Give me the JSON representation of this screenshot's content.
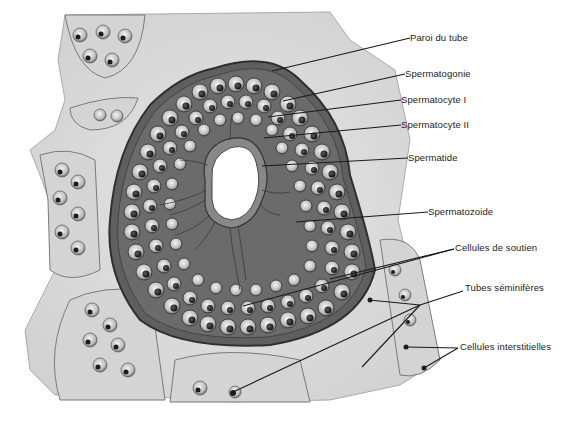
{
  "figure": {
    "colors": {
      "background": "#ffffff",
      "tissue": "#d9d9d9",
      "tissue_light": "#e8e8e8",
      "cell_outline": "#3a3a3a",
      "nucleus": "#2a2a2a",
      "leader_line": "#1a1a1a",
      "label_text": "#222222"
    }
  },
  "labels": [
    {
      "id": "paroi",
      "text": "Paroi du tube",
      "x": 410,
      "y": 33,
      "line": [
        [
          410,
          38
        ],
        [
          272,
          71
        ]
      ]
    },
    {
      "id": "spermatogonie",
      "text": "Spermatogonie",
      "x": 405,
      "y": 69,
      "line": [
        [
          405,
          74
        ],
        [
          283,
          101
        ]
      ]
    },
    {
      "id": "spermatocyte1",
      "text": "Spermatocyte I",
      "x": 401,
      "y": 95,
      "line": [
        [
          401,
          100
        ],
        [
          268,
          117
        ]
      ]
    },
    {
      "id": "spermatocyte2",
      "text": "Spermatocyte II",
      "x": 401,
      "y": 120,
      "line": [
        [
          401,
          125
        ],
        [
          264,
          138
        ]
      ]
    },
    {
      "id": "spermatide",
      "text": "Spermatide",
      "x": 408,
      "y": 153,
      "line": [
        [
          408,
          158
        ],
        [
          262,
          166
        ]
      ]
    },
    {
      "id": "spermatozoide",
      "text": "Spermatozoide",
      "x": 428,
      "y": 207,
      "line": [
        [
          428,
          212
        ],
        [
          296,
          222
        ]
      ]
    },
    {
      "id": "soutien",
      "text": "Cellules de soutien",
      "x": 455,
      "y": 243,
      "lines": [
        [
          [
            454,
            249
          ],
          [
            243,
            306
          ]
        ],
        [
          [
            454,
            249
          ],
          [
            330,
            279
          ]
        ]
      ]
    },
    {
      "id": "tubes",
      "text": "Tubes séminifères",
      "x": 465,
      "y": 283,
      "lines": [
        [
          [
            463,
            291
          ],
          [
            420,
            305
          ]
        ],
        [
          [
            420,
            305
          ],
          [
            233,
            392
          ]
        ],
        [
          [
            420,
            305
          ],
          [
            362,
            367
          ]
        ],
        [
          [
            420,
            305
          ],
          [
            369,
            300
          ]
        ]
      ]
    },
    {
      "id": "interstitielles",
      "text": "Cellules interstitielles",
      "x": 460,
      "y": 342,
      "lines": [
        [
          [
            458,
            348
          ],
          [
            406,
            347
          ]
        ],
        [
          [
            458,
            348
          ],
          [
            424,
            368
          ]
        ]
      ]
    }
  ]
}
